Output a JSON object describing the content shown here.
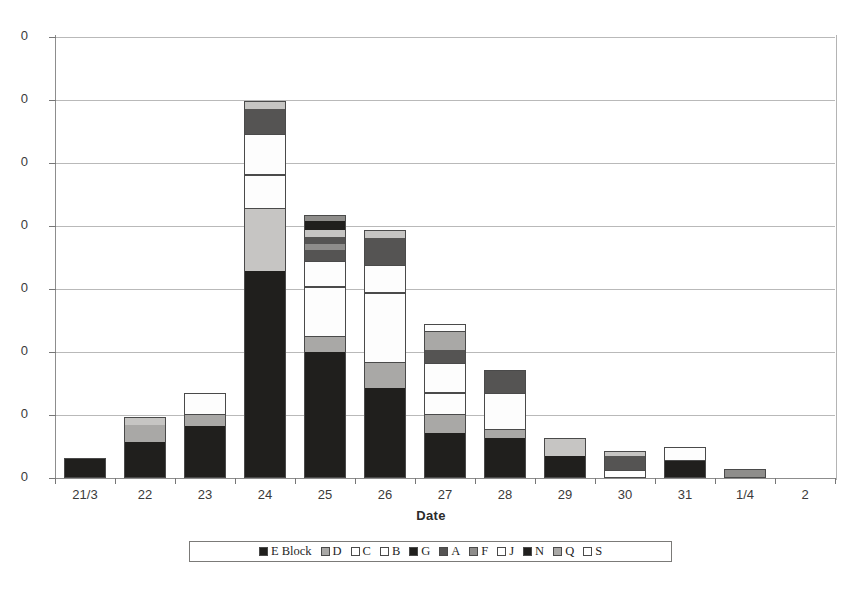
{
  "chart_data": {
    "type": "bar",
    "stacked": true,
    "title": "",
    "subtitle": "",
    "xlabel": "Date",
    "ylabel": "",
    "grid": true,
    "legend_position": "bottom",
    "ylim": [
      0,
      70
    ],
    "ytick_values": [
      0,
      10,
      20,
      30,
      40,
      50,
      60,
      70
    ],
    "ytick_labels": [
      "0",
      "0",
      "0",
      "0",
      "0",
      "0",
      "0",
      "0"
    ],
    "ytick_labels_note": "y-axis numerals are clipped at the left page edge in the scan; only the trailing 0 of each label is visible",
    "categories": [
      "21/3",
      "22",
      "23",
      "24",
      "25",
      "26",
      "27",
      "28",
      "29",
      "30",
      "31",
      "1/4",
      "2"
    ],
    "series": [
      {
        "name": "E Block",
        "color": "#201f1d",
        "values": [
          5,
          9,
          13,
          33,
          20,
          7,
          4,
          3,
          3,
          0,
          3,
          0,
          0
        ]
      },
      {
        "name": "D",
        "color": "#a9a8a6",
        "values": [
          0,
          4,
          3,
          10,
          2,
          3,
          2,
          1,
          2,
          0,
          0,
          1,
          0
        ]
      },
      {
        "name": "C",
        "color": "#fdfdfd",
        "values": [
          0,
          0,
          0,
          4,
          6,
          0,
          2,
          0,
          0,
          0,
          0,
          0,
          0
        ]
      },
      {
        "name": "B",
        "color": "#fdfdfd",
        "values": [
          0,
          0,
          2,
          5,
          4,
          11,
          3,
          6,
          0,
          0,
          2,
          0,
          0
        ]
      },
      {
        "name": "G",
        "color": "#201f1d",
        "values": [
          0,
          0,
          0,
          0,
          1,
          0,
          0,
          0,
          0,
          1,
          0,
          0,
          0
        ]
      },
      {
        "name": "A",
        "color": "#555453",
        "values": [
          0,
          0,
          0,
          3,
          1,
          3,
          2,
          3,
          0,
          2,
          0,
          0,
          0
        ]
      },
      {
        "name": "F",
        "color": "#8e8d8b",
        "values": [
          0,
          0,
          0,
          0,
          1,
          0,
          2,
          0,
          0,
          1,
          0,
          0,
          0
        ]
      },
      {
        "name": "J",
        "color": "#fdfdfd",
        "values": [
          0,
          0,
          0,
          0,
          1,
          0,
          1,
          0,
          0,
          0,
          0,
          0,
          0
        ]
      },
      {
        "name": "N",
        "color": "#201f1d",
        "values": [
          0,
          0,
          0,
          0,
          2,
          0,
          0,
          0,
          0,
          0,
          0,
          0,
          0
        ]
      },
      {
        "name": "Q",
        "color": "#a9a8a6",
        "values": [
          0,
          2,
          0,
          2,
          1,
          2,
          0,
          0,
          0,
          0,
          0,
          0,
          0
        ]
      },
      {
        "name": "S",
        "color": "#fdfdfd",
        "values": [
          0,
          0,
          0,
          0,
          0,
          0,
          0,
          0,
          0,
          0,
          0,
          0,
          0
        ]
      }
    ],
    "totals": [
      5,
      15,
      18,
      57,
      39,
      26,
      16,
      13,
      5,
      4,
      5,
      1,
      0
    ]
  },
  "axis": {
    "x_title": "Date",
    "x_labels": [
      "21/3",
      "22",
      "23",
      "24",
      "25",
      "26",
      "27",
      "28",
      "29",
      "30",
      "31",
      "1/4",
      "2"
    ],
    "y_labels": [
      "0",
      "0",
      "0",
      "0",
      "0",
      "0",
      "0",
      "0"
    ]
  },
  "legend": {
    "items": [
      {
        "label": "E Block",
        "swatch": "black"
      },
      {
        "label": "D",
        "swatch": "gray"
      },
      {
        "label": "C",
        "swatch": "white"
      },
      {
        "label": "B",
        "swatch": "white"
      },
      {
        "label": "G",
        "swatch": "black"
      },
      {
        "label": "A",
        "swatch": "dark-gray"
      },
      {
        "label": "F",
        "swatch": "mid-gray"
      },
      {
        "label": "J",
        "swatch": "white"
      },
      {
        "label": "N",
        "swatch": "black"
      },
      {
        "label": "Q",
        "swatch": "gray"
      },
      {
        "label": "S",
        "swatch": "white"
      }
    ]
  },
  "bars": [
    {
      "category": "21/3",
      "segments": [
        {
          "fill": "f-black",
          "h": 20
        }
      ]
    },
    {
      "category": "22",
      "segments": [
        {
          "fill": "f-black",
          "h": 36
        },
        {
          "fill": "f-gray",
          "h": 17
        },
        {
          "fill": "f-ltgray",
          "h": 8
        }
      ]
    },
    {
      "category": "23",
      "segments": [
        {
          "fill": "f-black",
          "h": 52
        },
        {
          "fill": "f-gray",
          "h": 11
        },
        {
          "fill": "f-white",
          "h": 22
        }
      ]
    },
    {
      "category": "24",
      "segments": [
        {
          "fill": "f-black",
          "h": 207
        },
        {
          "fill": "f-ltgray",
          "h": 62
        },
        {
          "fill": "f-white",
          "h": 34
        },
        {
          "fill": "f-white",
          "h": 41
        },
        {
          "fill": "f-dkgray",
          "h": 25
        },
        {
          "fill": "f-ltgray",
          "h": 8
        }
      ]
    },
    {
      "category": "25",
      "segments": [
        {
          "fill": "f-black",
          "h": 126
        },
        {
          "fill": "f-gray",
          "h": 15
        },
        {
          "fill": "f-white",
          "h": 50
        },
        {
          "fill": "f-white",
          "h": 26
        },
        {
          "fill": "f-dkgray",
          "h": 11
        },
        {
          "fill": "f-midgray",
          "h": 6
        },
        {
          "fill": "f-dkgray",
          "h": 7
        },
        {
          "fill": "f-ltgray",
          "h": 7
        },
        {
          "fill": "f-black",
          "h": 9
        },
        {
          "fill": "f-midgray",
          "h": 6
        }
      ]
    },
    {
      "category": "26",
      "segments": [
        {
          "fill": "f-black",
          "h": 90
        },
        {
          "fill": "f-gray",
          "h": 25
        },
        {
          "fill": "f-white",
          "h": 70
        },
        {
          "fill": "f-white",
          "h": 28
        },
        {
          "fill": "f-dkgray",
          "h": 27
        },
        {
          "fill": "f-ltgray",
          "h": 8
        }
      ]
    },
    {
      "category": "27",
      "segments": [
        {
          "fill": "f-black",
          "h": 45
        },
        {
          "fill": "f-gray",
          "h": 18
        },
        {
          "fill": "f-white",
          "h": 22
        },
        {
          "fill": "f-white",
          "h": 30
        },
        {
          "fill": "f-dkgray",
          "h": 13
        },
        {
          "fill": "f-gray",
          "h": 18
        },
        {
          "fill": "f-white",
          "h": 8
        }
      ]
    },
    {
      "category": "28",
      "segments": [
        {
          "fill": "f-black",
          "h": 40
        },
        {
          "fill": "f-gray",
          "h": 8
        },
        {
          "fill": "f-white",
          "h": 37
        },
        {
          "fill": "f-dkgray",
          "h": 23
        }
      ]
    },
    {
      "category": "29",
      "segments": [
        {
          "fill": "f-black",
          "h": 22
        },
        {
          "fill": "f-ltgray",
          "h": 18
        }
      ]
    },
    {
      "category": "30",
      "segments": [
        {
          "fill": "f-white",
          "h": 8
        },
        {
          "fill": "f-dkgray",
          "h": 14
        },
        {
          "fill": "f-ltgray",
          "h": 5
        }
      ]
    },
    {
      "category": "31",
      "segments": [
        {
          "fill": "f-black",
          "h": 17
        },
        {
          "fill": "f-white",
          "h": 14
        }
      ]
    },
    {
      "category": "1/4",
      "segments": [
        {
          "fill": "f-midgray",
          "h": 9
        }
      ]
    },
    {
      "category": "2",
      "segments": []
    }
  ]
}
